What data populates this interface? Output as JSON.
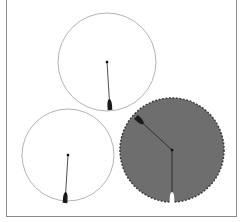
{
  "diagram": {
    "frame": {
      "color": "#8a8a8a"
    },
    "dials": [
      {
        "id": "top",
        "cx": 107,
        "cy": 62,
        "r": 49,
        "fill": "#ffffff",
        "stroke": "#a0a0a0",
        "dashed": false,
        "needle": {
          "x2": 110,
          "y2": 110,
          "color": "#222222",
          "tip": "dark-teardrop"
        }
      },
      {
        "id": "bottom-left",
        "cx": 68,
        "cy": 155,
        "r": 46,
        "fill": "#ffffff",
        "stroke": "#a0a0a0",
        "dashed": false,
        "needle": {
          "x2": 65,
          "y2": 203,
          "color": "#222222",
          "tip": "dark-teardrop"
        }
      },
      {
        "id": "bottom-right",
        "cx": 172,
        "cy": 150,
        "r": 52,
        "fill": "#6e6e6e",
        "stroke": "#3a3a3a",
        "dashed": true,
        "needle": {
          "x2": 172,
          "y2": 203,
          "color": "#222222",
          "tip": "white-teardrop"
        },
        "second_needle": {
          "x2": 136,
          "y2": 117,
          "color": "#2a2a2a",
          "tip": "dark-wedge"
        }
      }
    ]
  }
}
